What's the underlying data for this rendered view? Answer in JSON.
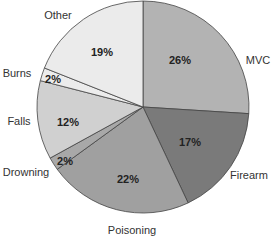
{
  "chart_data": {
    "type": "pie",
    "title": "",
    "start_angle_deg": 0,
    "direction": "clockwise",
    "slices": [
      {
        "label": "MVC",
        "value": 26,
        "display": "26%",
        "color": "#b3b3b3"
      },
      {
        "label": "Firearm",
        "value": 17,
        "display": "17%",
        "color": "#7a7a7a"
      },
      {
        "label": "Poisoning",
        "value": 22,
        "display": "22%",
        "color": "#a0a0a0"
      },
      {
        "label": "Drowning",
        "value": 2,
        "display": "2%",
        "color": "#a8a8a8"
      },
      {
        "label": "Falls",
        "value": 12,
        "display": "12%",
        "color": "#d0d0d0"
      },
      {
        "label": "Burns",
        "value": 2,
        "display": "2%",
        "color": "#ececec"
      },
      {
        "label": "Other",
        "value": 19,
        "display": "19%",
        "color": "#ebebeb"
      }
    ]
  },
  "labels": {
    "mvc": "MVC",
    "firearm": "Firearm",
    "poisoning": "Poisoning",
    "drowning": "Drowning",
    "falls": "Falls",
    "burns": "Burns",
    "other": "Other"
  },
  "pcts": {
    "mvc": "26%",
    "firearm": "17%",
    "poisoning": "22%",
    "drowning": "2%",
    "falls": "12%",
    "burns": "2%",
    "other": "19%"
  }
}
